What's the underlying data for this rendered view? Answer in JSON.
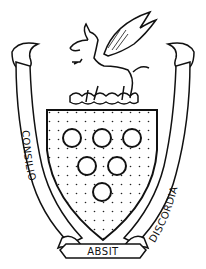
{
  "image": {
    "subject": "coat of arms",
    "colors": {
      "ink": "#111111",
      "background": "#ffffff"
    }
  },
  "crest": {
    "figure": "wyvern"
  },
  "shield": {
    "charges": "bezants",
    "charge_count": 6,
    "arrangement": "3, 2, 1",
    "field_pattern": "dotted"
  },
  "motto": {
    "left": "CONSILIO",
    "center": "ABSIT",
    "right": "DISCORDIA"
  }
}
